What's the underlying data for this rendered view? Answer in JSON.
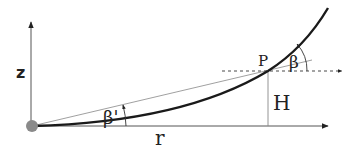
{
  "diagram": {
    "labels": {
      "z_axis": "z",
      "r_axis": "r",
      "point": "P",
      "height": "H",
      "angle_tangent": "β",
      "angle_chord": "β'"
    },
    "colors": {
      "curve": "#1a1a1a",
      "axis": "#555555",
      "thin_line": "#888888",
      "origin_marker": "#8a8a8a",
      "text": "#222222"
    }
  }
}
